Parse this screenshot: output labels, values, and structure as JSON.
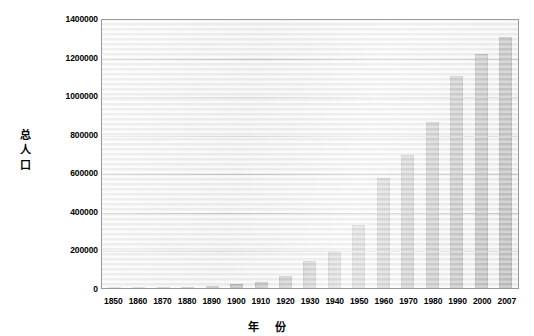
{
  "chart_data": {
    "type": "bar",
    "title": "",
    "xlabel": "年 份",
    "ylabel": "总人口",
    "ylabel_chars": [
      "总",
      "人",
      "口"
    ],
    "categories": [
      "1850",
      "1860",
      "1870",
      "1880",
      "1890",
      "1900",
      "1910",
      "1920",
      "1930",
      "1940",
      "1950",
      "1960",
      "1970",
      "1980",
      "1990",
      "2000",
      "2007"
    ],
    "values": [
      1000,
      1500,
      2000,
      5000,
      12000,
      20000,
      30000,
      60000,
      140000,
      190000,
      325000,
      570000,
      690000,
      860000,
      1100000,
      1215000,
      1300000
    ],
    "series": [
      {
        "name": "总人口",
        "values": [
          1000,
          1500,
          2000,
          5000,
          12000,
          20000,
          30000,
          60000,
          140000,
          190000,
          325000,
          570000,
          690000,
          860000,
          1100000,
          1215000,
          1300000
        ]
      }
    ],
    "ylim": [
      0,
      1400000
    ],
    "ytick_values": [
      0,
      200000,
      400000,
      600000,
      800000,
      1000000,
      1200000,
      1400000
    ],
    "ytick_labels": [
      "0",
      "200000",
      "400000",
      "600000",
      "800000",
      "1000000",
      "1200000",
      "1400000"
    ],
    "grid": true,
    "grid_axis": "y",
    "legend": false,
    "legend_position": "none",
    "bar_color": "#737373",
    "bar_border_color": "#4a4a4a",
    "plot_background": "#f2f2f2",
    "gridline_color": "#8d8d8d",
    "plot_border_color": "#9a9a9a"
  }
}
